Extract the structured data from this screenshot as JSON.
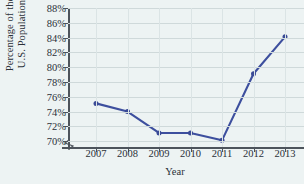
{
  "chart_data": {
    "type": "line",
    "title": "",
    "xlabel": "Year",
    "ylabel_lines": [
      "Percentage of the",
      "U.S. Population"
    ],
    "categories": [
      "2007",
      "2008",
      "2009",
      "2010",
      "2011",
      "2012",
      "2013"
    ],
    "values": [
      75.1,
      74.0,
      71.1,
      71.1,
      70.1,
      79.1,
      84.1
    ],
    "series": [
      {
        "name": "Percentage of the U.S. Population",
        "values": [
          75.1,
          74.0,
          71.1,
          71.1,
          70.1,
          79.1,
          84.1
        ]
      }
    ],
    "ylim": [
      69.2,
      88.0
    ],
    "ytick_values": [
      70,
      72,
      74,
      76,
      78,
      80,
      82,
      84,
      86,
      88
    ],
    "ytick_labels": [
      "70%",
      "72%",
      "74%",
      "76%",
      "78%",
      "80%",
      "82%",
      "84%",
      "86%",
      "88%"
    ],
    "xtick_labels": [
      "2007",
      "2008",
      "2009",
      "2010",
      "2011",
      "2012",
      "2013"
    ],
    "grid": true,
    "grid_axis": "both",
    "legend": false,
    "legend_position": "none",
    "axis_break": true,
    "marker": "circle",
    "colors": {
      "line": "#3d4f9e",
      "marker": "#3a4a96",
      "background": "#edf3f3",
      "grid": "#cfd9da",
      "axis": "#4d545c",
      "text": "#2b3038"
    }
  }
}
